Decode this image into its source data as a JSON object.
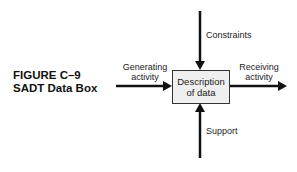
{
  "figure": {
    "caption_line1": "FIGURE C–9",
    "caption_line2": "SADT Data Box"
  },
  "box": {
    "line1": "Description",
    "line2": "of data",
    "fill": "#efefef"
  },
  "arrows": {
    "input": {
      "line1": "Generating",
      "line2": "activity"
    },
    "output": {
      "line1": "Receiving",
      "line2": "activity"
    },
    "control": {
      "label": "Constraints"
    },
    "mechanism": {
      "label": "Support"
    }
  },
  "colors": {
    "line": "#111111"
  }
}
